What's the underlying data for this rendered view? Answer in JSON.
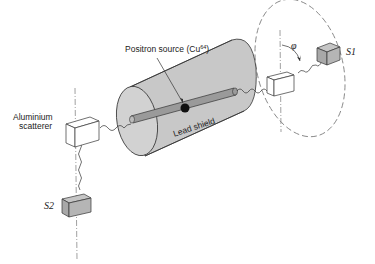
{
  "diagram": {
    "labels": {
      "source_prefix": "Positron  source (Cu",
      "source_sup": "64",
      "source_suffix": ")",
      "shield": "Lead shield",
      "scatterer_line1": "Aluminium",
      "scatterer_line2": "scatterer",
      "detector1": "S1",
      "detector2": "S2",
      "angle": "φ"
    },
    "colors": {
      "cylinder": "#c8c8c8",
      "cylinder_face": "#d2d2d2",
      "rod": "#9a9a9a",
      "source_dot": "#111111",
      "detector": "#b5b5b5",
      "line": "#333333",
      "dashed": "#777777"
    }
  }
}
